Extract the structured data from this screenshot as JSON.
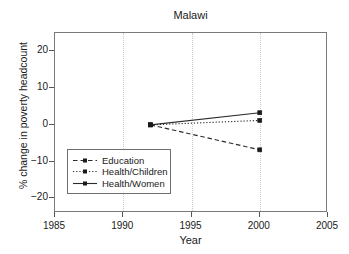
{
  "chart_data": {
    "type": "line",
    "title": "Malawi",
    "xlabel": "Year",
    "ylabel": "% change in poverty headcount",
    "xlim": [
      1985,
      2005
    ],
    "ylim": [
      -24,
      25
    ],
    "xticks": [
      1985,
      1990,
      1995,
      2000,
      2005
    ],
    "xtick_labels": [
      "1985",
      "1990",
      "1995",
      "2000",
      "2005"
    ],
    "yticks": [
      20,
      10,
      0,
      -10,
      -20
    ],
    "ytick_labels": [
      "20",
      "10",
      "0",
      "−10",
      "−20"
    ],
    "grid": "vertical-dotted-at-1990-1995-2000",
    "legend_position": "lower-left-inside",
    "x": [
      1992,
      2000
    ],
    "series": [
      {
        "name": "Education",
        "style": "dashed",
        "marker": "square",
        "values": [
          0.0,
          -6.8
        ]
      },
      {
        "name": "Health/Children",
        "style": "dotted",
        "marker": "square",
        "values": [
          0.0,
          1.2
        ]
      },
      {
        "name": "Health/Women",
        "style": "solid",
        "marker": "square",
        "values": [
          0.0,
          3.3
        ]
      }
    ]
  },
  "legend": {
    "entries": [
      {
        "label": "Education"
      },
      {
        "label": "Health/Children"
      },
      {
        "label": "Health/Women"
      }
    ]
  }
}
